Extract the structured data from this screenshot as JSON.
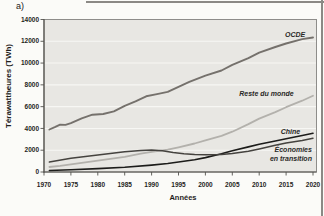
{
  "figure_label": "a)",
  "colors": {
    "page_bg": "#fbfbf8",
    "plot_bg": "#e8e7e3",
    "gridline": "#f7f7f4",
    "frame": "#8e8d8a",
    "axis": "#54524e",
    "tick_text": "#1f1e1c",
    "label_text": "#2a2927",
    "figure_rule": "#8b8985"
  },
  "chart_data": {
    "type": "line",
    "title": "",
    "xlabel": "Années",
    "ylabel": "Térawattheures (TWh)",
    "xlim": [
      1970,
      2020
    ],
    "ylim": [
      0,
      14000
    ],
    "x_ticks": [
      1970,
      1975,
      1980,
      1985,
      1990,
      1995,
      2000,
      2005,
      2010,
      2015,
      2020
    ],
    "y_ticks": [
      0,
      2000,
      4000,
      6000,
      8000,
      10000,
      12000,
      14000
    ],
    "grid": "horizontal-white",
    "legend_position": "inline-labels-on-plot",
    "series": [
      {
        "name": "OCDE",
        "color": "#75716c",
        "width": 1.9,
        "points": [
          [
            1971,
            3900
          ],
          [
            1972,
            4120
          ],
          [
            1973,
            4350
          ],
          [
            1974,
            4320
          ],
          [
            1975,
            4480
          ],
          [
            1977,
            4930
          ],
          [
            1979,
            5260
          ],
          [
            1981,
            5320
          ],
          [
            1983,
            5560
          ],
          [
            1985,
            6080
          ],
          [
            1987,
            6480
          ],
          [
            1989,
            6950
          ],
          [
            1991,
            7150
          ],
          [
            1993,
            7350
          ],
          [
            1995,
            7820
          ],
          [
            1997,
            8270
          ],
          [
            2000,
            8850
          ],
          [
            2003,
            9320
          ],
          [
            2005,
            9830
          ],
          [
            2008,
            10450
          ],
          [
            2010,
            10950
          ],
          [
            2013,
            11480
          ],
          [
            2015,
            11800
          ],
          [
            2018,
            12200
          ],
          [
            2020,
            12350
          ]
        ]
      },
      {
        "name": "Reste du monde",
        "color": "#b3b1ac",
        "width": 1.8,
        "points": [
          [
            1971,
            460
          ],
          [
            1973,
            560
          ],
          [
            1975,
            700
          ],
          [
            1978,
            900
          ],
          [
            1980,
            1050
          ],
          [
            1983,
            1250
          ],
          [
            1985,
            1400
          ],
          [
            1988,
            1680
          ],
          [
            1990,
            1850
          ],
          [
            1993,
            2050
          ],
          [
            1995,
            2270
          ],
          [
            1998,
            2620
          ],
          [
            2000,
            2900
          ],
          [
            2003,
            3320
          ],
          [
            2005,
            3700
          ],
          [
            2008,
            4400
          ],
          [
            2010,
            4900
          ],
          [
            2013,
            5500
          ],
          [
            2015,
            5950
          ],
          [
            2018,
            6550
          ],
          [
            2020,
            7000
          ]
        ]
      },
      {
        "name": "Chine",
        "color": "#1c1c1a",
        "width": 1.6,
        "points": [
          [
            1971,
            140
          ],
          [
            1975,
            210
          ],
          [
            1980,
            310
          ],
          [
            1985,
            430
          ],
          [
            1990,
            630
          ],
          [
            1993,
            780
          ],
          [
            1995,
            920
          ],
          [
            1998,
            1120
          ],
          [
            2000,
            1320
          ],
          [
            2003,
            1680
          ],
          [
            2005,
            1950
          ],
          [
            2008,
            2300
          ],
          [
            2010,
            2550
          ],
          [
            2013,
            2850
          ],
          [
            2015,
            3050
          ],
          [
            2018,
            3350
          ],
          [
            2020,
            3560
          ]
        ]
      },
      {
        "name": "Économies en transition",
        "color": "#45433f",
        "width": 1.5,
        "points": [
          [
            1971,
            920
          ],
          [
            1975,
            1260
          ],
          [
            1980,
            1560
          ],
          [
            1985,
            1860
          ],
          [
            1988,
            1980
          ],
          [
            1990,
            2020
          ],
          [
            1992,
            1950
          ],
          [
            1994,
            1780
          ],
          [
            1996,
            1670
          ],
          [
            1998,
            1600
          ],
          [
            2000,
            1580
          ],
          [
            2003,
            1620
          ],
          [
            2005,
            1700
          ],
          [
            2008,
            1900
          ],
          [
            2010,
            2120
          ],
          [
            2013,
            2450
          ],
          [
            2015,
            2650
          ],
          [
            2018,
            2900
          ],
          [
            2020,
            3100
          ]
        ]
      }
    ],
    "annotations": [
      {
        "lines": [
          "OCDE"
        ],
        "x": 2014.8,
        "y": 12950,
        "anchor": "start"
      },
      {
        "lines": [
          "Reste du monde"
        ],
        "x": 2006.3,
        "y": 7500,
        "anchor": "start"
      },
      {
        "lines": [
          "Chine"
        ],
        "x": 2014.0,
        "y": 4050,
        "anchor": "start"
      },
      {
        "lines": [
          "Économies",
          "en transition"
        ],
        "x": 2019.8,
        "y": 2350,
        "anchor": "end"
      }
    ]
  }
}
